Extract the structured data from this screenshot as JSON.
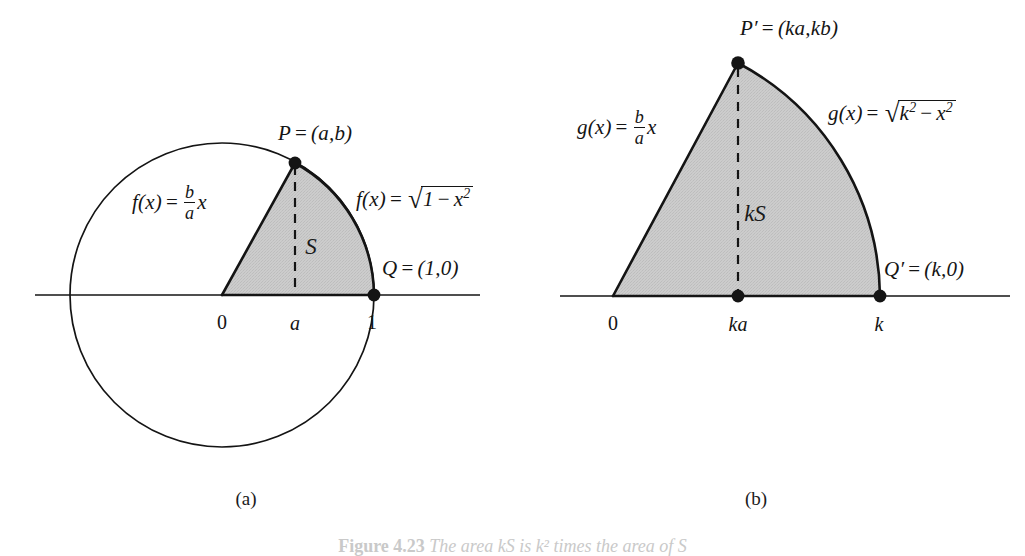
{
  "figure": {
    "background_color": "#ffffff",
    "ink_color": "#141414",
    "shade_color": "#c9c9c9",
    "panels": [
      {
        "id": "a",
        "sub_caption": "(a)",
        "point_labels": [
          {
            "name": "P",
            "text": "P = (a,b)"
          },
          {
            "name": "Q",
            "text": "Q = (1,0)"
          }
        ],
        "function_left": "f(x) = (b/a)x",
        "function_right": "f(x) = sqrt(1 - x^2)",
        "function_left_parts": {
          "fn": "f(x)",
          "eq": "=",
          "num": "b",
          "den": "a",
          "var": "x"
        },
        "function_right_parts": {
          "fn": "f(x)",
          "eq": "=",
          "radicand": "1",
          "minus": "−",
          "term": "x",
          "exp": "2"
        },
        "region_label": "S",
        "axis_ticks": [
          {
            "label": "0",
            "italic": false
          },
          {
            "label": "a",
            "italic": true
          },
          {
            "label": "1",
            "italic": false
          }
        ],
        "point_P_label_parts": {
          "sym": "P",
          "eq": "=",
          "coords": "(a,b)"
        },
        "point_Q_label_parts": {
          "sym": "Q",
          "eq": "=",
          "coords": "(1,0)"
        }
      },
      {
        "id": "b",
        "sub_caption": "(b)",
        "point_labels": [
          {
            "name": "P-prime",
            "text": "P' = (ka,kb)"
          },
          {
            "name": "Q-prime",
            "text": "Q' = (k,0)"
          }
        ],
        "function_left": "g(x) = (b/a)x",
        "function_right": "g(x) = sqrt(k^2 - x^2)",
        "function_left_parts": {
          "fn": "g(x)",
          "eq": "=",
          "num": "b",
          "den": "a",
          "var": "x"
        },
        "function_right_parts": {
          "fn": "g(x)",
          "eq": "=",
          "radicand": "k",
          "rad_exp": "2",
          "minus": "−",
          "term": "x",
          "exp": "2"
        },
        "region_label": "kS",
        "axis_ticks": [
          {
            "label": "0",
            "italic": false
          },
          {
            "label": "ka",
            "italic": true
          },
          {
            "label": "k",
            "italic": true
          }
        ],
        "point_P_label_parts": {
          "sym": "P",
          "prime": "′",
          "eq": "=",
          "coords": "(ka,kb)"
        },
        "point_Q_label_parts": {
          "sym": "Q",
          "prime": "′",
          "eq": "=",
          "coords": "(k,0)"
        }
      }
    ]
  },
  "caption": {
    "figure_number": "Figure 4.23",
    "text": "The area kS is k² times the area of S"
  }
}
